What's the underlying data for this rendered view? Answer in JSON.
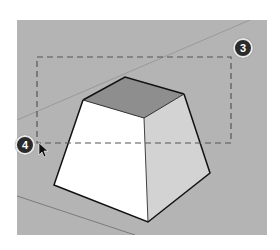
{
  "scene": {
    "description": "3D viewport showing a truncated pyramid with a dashed selection rectangle",
    "background_color": "#b4b4b4",
    "top_face_color": "#8e8e8e",
    "left_face_color": "#ffffff",
    "right_face_color": "#d2d2d2"
  },
  "selection_box": {
    "style": "dashed",
    "color": "#555555"
  },
  "callouts": [
    {
      "number": "3",
      "position": "top-right corner of selection box"
    },
    {
      "number": "4",
      "position": "bottom-left corner of selection box"
    }
  ]
}
